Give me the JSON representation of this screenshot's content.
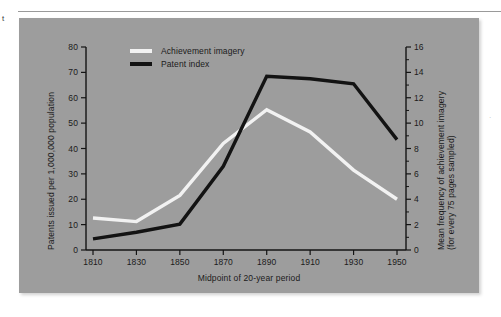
{
  "page": {
    "margin_fragment": "t",
    "speck": "·"
  },
  "chart_data": {
    "type": "line",
    "title": "",
    "xlabel": "Midpoint of 20-year period",
    "ylabel": "Patents issued per 1,000,000 population",
    "y2label_line1": "Mean frequency of achievement imagery",
    "y2label_line2": "(for every 75 pages sampled)",
    "x": [
      1810,
      1830,
      1850,
      1870,
      1890,
      1910,
      1930,
      1950
    ],
    "xticklabels": [
      "1810",
      "1830",
      "1850",
      "1870",
      "1890",
      "1910",
      "1930",
      "1950"
    ],
    "xlim": [
      1800,
      1960
    ],
    "ylim": [
      0,
      80
    ],
    "yticks": [
      0,
      10,
      20,
      30,
      40,
      50,
      60,
      70,
      80
    ],
    "yticklabels": [
      "0",
      "10",
      "20",
      "30",
      "40",
      "50",
      "60",
      "70",
      "80"
    ],
    "y2lim": [
      0,
      16
    ],
    "y2ticks": [
      0,
      2,
      4,
      6,
      8,
      10,
      12,
      14,
      16
    ],
    "y2ticklabels": [
      "0",
      "2",
      "4",
      "6",
      "8",
      "10",
      "12",
      "14",
      "16"
    ],
    "y2minorticks": [
      1,
      3,
      5,
      7,
      9,
      11,
      13,
      15
    ],
    "grid": false,
    "legend_position": "top-left-inside",
    "series": [
      {
        "name": "Achievement imagery",
        "axis": "right",
        "color": "#f2f2f2",
        "values_left_scale": [
          12.6,
          11.2,
          21.5,
          42.0,
          55.3,
          46.5,
          31.5,
          20.0
        ],
        "values": [
          2.5,
          2.2,
          4.3,
          8.4,
          11.1,
          9.3,
          6.3,
          4.0
        ]
      },
      {
        "name": "Patent index",
        "axis": "left",
        "color": "#131313",
        "values": [
          4.4,
          7.0,
          10.2,
          33.0,
          68.5,
          67.5,
          65.5,
          43.5
        ],
        "values_right_scale": [
          0.9,
          1.4,
          2.0,
          6.6,
          13.7,
          13.5,
          13.1,
          8.7
        ]
      }
    ]
  },
  "legend": {
    "items": [
      {
        "label": "Achievement imagery",
        "color": "#f2f2f2"
      },
      {
        "label": "Patent index",
        "color": "#131313"
      }
    ]
  }
}
